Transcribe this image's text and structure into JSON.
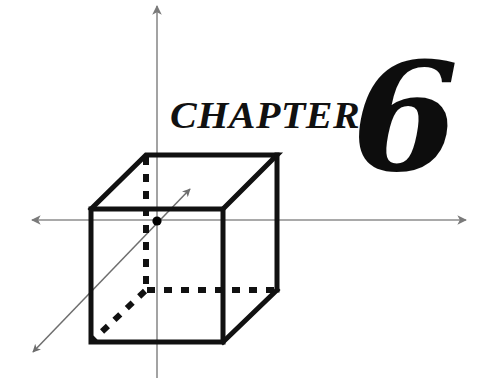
{
  "page": {
    "width": 497,
    "height": 378,
    "background_color": "#ffffff"
  },
  "heading": {
    "word": "CHAPTER",
    "number": "6"
  },
  "figure": {
    "name": "cube-with-3d-axes",
    "colors": {
      "axis": "#8c8c8c",
      "cube_edge": "#111111",
      "hidden_edge": "#111111",
      "origin_dot": "#000000",
      "diagonal_axis": "#6e6e6e"
    },
    "axes": [
      {
        "name": "vertical-axis",
        "orientation": "vertical",
        "arrow": "top"
      },
      {
        "name": "horizontal-axis",
        "orientation": "horizontal",
        "arrow": "both"
      },
      {
        "name": "depth-axis",
        "orientation": "diagonal",
        "arrow": "both"
      }
    ],
    "origin_label": "origin",
    "cube": {
      "front_face": {
        "left": 91,
        "top": 209,
        "right": 223,
        "bottom": 342
      },
      "depth_offset": {
        "dx": 55,
        "dy": -54
      },
      "hidden_edges": 3,
      "visible_edges": 9
    }
  }
}
